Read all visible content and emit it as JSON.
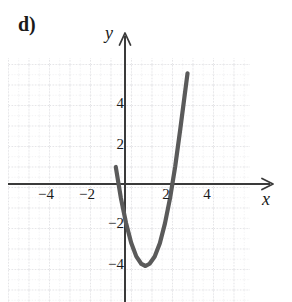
{
  "figure": {
    "part_label": "d)",
    "background_color": "#ffffff",
    "curve_color": "#5a5a5a",
    "axis_color": "#3a3a3a",
    "grid_color": "#d8d8dc",
    "text_color": "#1a1a1a"
  },
  "axes": {
    "x_name": "x",
    "y_name": "y",
    "x_tick_labels": [
      "−4",
      "−2",
      "2",
      "4"
    ],
    "y_tick_labels": [
      "4",
      "2",
      "−2",
      "−4"
    ]
  },
  "chart_data": {
    "type": "line",
    "title": "d)",
    "xlabel": "x",
    "ylabel": "y",
    "grid": true,
    "legend": "none",
    "xlim": [
      -5.7,
      6.1
    ],
    "ylim": [
      -7.3,
      6.2
    ],
    "xticks": [
      -4,
      -2,
      2,
      4
    ],
    "yticks": [
      4,
      2,
      -2,
      -4
    ],
    "origin_px": {
      "x": 125,
      "y": 184
    },
    "unit_px": 20.5,
    "series": [
      {
        "name": "parabola",
        "shape": "parabola",
        "vertex": [
          1,
          -4
        ],
        "leading_coefficient": 2.3,
        "equation": "y = 2.3(x - 1)^2 - 4",
        "roots_approx": [
          -0.32,
          2.32
        ],
        "y_intercept_approx": -1.7,
        "x": [
          -0.45,
          -0.2,
          0.05,
          0.3,
          0.55,
          0.8,
          1.0,
          1.2,
          1.45,
          1.7,
          1.95,
          2.2,
          2.45,
          2.7,
          3.05
        ],
        "y": [
          0.83,
          -0.69,
          -1.9,
          -2.87,
          -3.53,
          -3.9,
          -4.0,
          -3.89,
          -3.54,
          -2.89,
          -1.92,
          -0.68,
          0.86,
          2.7,
          5.4
        ]
      }
    ]
  }
}
